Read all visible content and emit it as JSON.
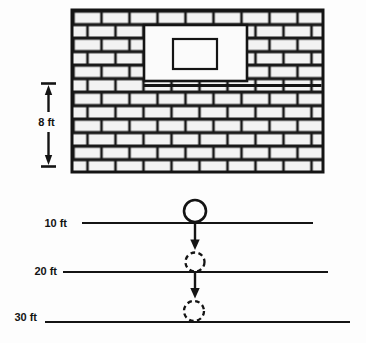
{
  "diagram": {
    "wall": {
      "height_label": "8 ft"
    },
    "depth_markers": [
      {
        "label": "10 ft"
      },
      {
        "label": "20 ft"
      },
      {
        "label": "30 ft"
      }
    ],
    "colors": {
      "ink": "#141414",
      "brick_fill": "#f3f3f3",
      "window_fill": "#fbfbfb",
      "paper": "#fdfdfd"
    }
  }
}
